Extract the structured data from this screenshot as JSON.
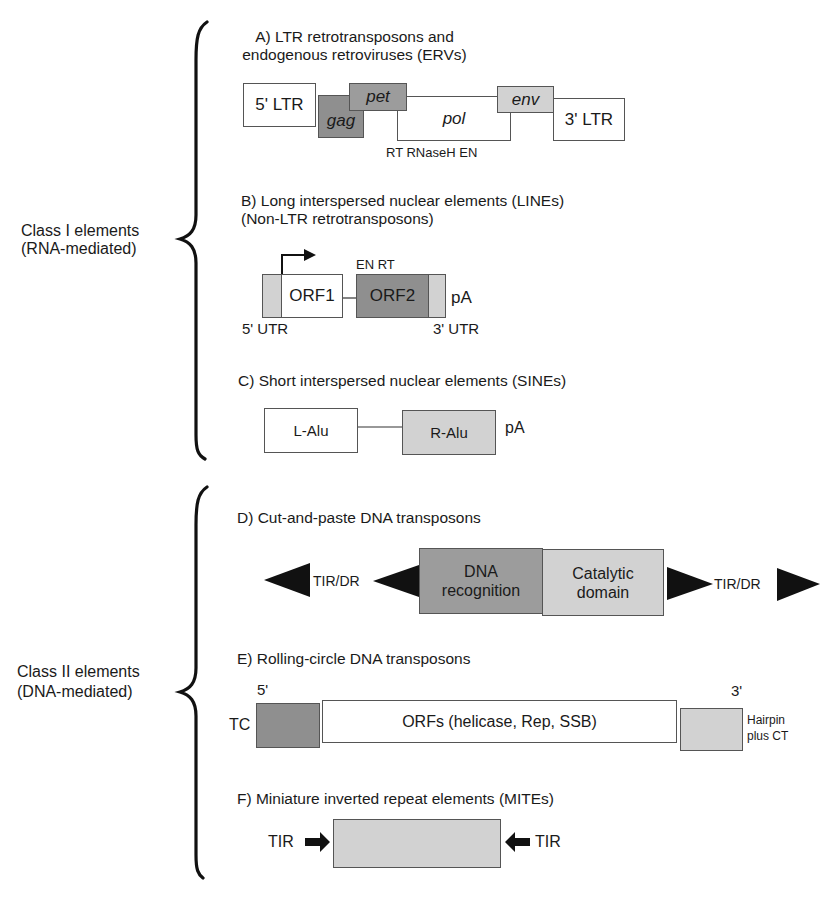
{
  "groups": [
    {
      "label_line1": "Class I elements",
      "label_line2": "(RNA-mediated)"
    },
    {
      "label_line1": "Class II elements",
      "label_line2": "(DNA-mediated)"
    }
  ],
  "sections": {
    "A": {
      "title_line1": "A) LTR retrotransposons and",
      "title_line2": "endogenous retroviruses (ERVs)",
      "ltr5": "5' LTR",
      "gag": "gag",
      "pet": "pet",
      "pol": "pol",
      "env": "env",
      "ltr3": "3' LTR",
      "pol_domains": "RT RNaseH EN"
    },
    "B": {
      "title_line1": "B) Long interspersed nuclear elements (LINEs)",
      "title_line2": "(Non-LTR retrotransposons)",
      "orf1": "ORF1",
      "orf2": "ORF2",
      "orf2_domains": "EN RT",
      "pa": "pA",
      "utr5": "5' UTR",
      "utr3": "3' UTR"
    },
    "C": {
      "title": "C) Short interspersed nuclear elements (SINEs)",
      "l_alu": "L-Alu",
      "r_alu": "R-Alu",
      "pa": "pA"
    },
    "D": {
      "title": "D) Cut-and-paste DNA transposons",
      "tir_left": "TIR/DR",
      "dna_line1": "DNA",
      "dna_line2": "recognition",
      "cat_line1": "Catalytic",
      "cat_line2": "domain",
      "tir_right": "TIR/DR"
    },
    "E": {
      "title": "E) Rolling-circle DNA transposons",
      "end5": "5'",
      "end3": "3'",
      "tc": "TC",
      "orfs": "ORFs (helicase, Rep, SSB)",
      "hairpin_line1": "Hairpin",
      "hairpin_line2": "plus CT"
    },
    "F": {
      "title": "F) Miniature inverted repeat elements (MITEs)",
      "tir_left": "TIR",
      "tir_right": "TIR"
    }
  },
  "colors": {
    "dark_fill": "#8f8f8f",
    "medium_fill": "#9c9c9c",
    "light_fill": "#d2d2d2",
    "stroke": "#1a1a1a"
  }
}
